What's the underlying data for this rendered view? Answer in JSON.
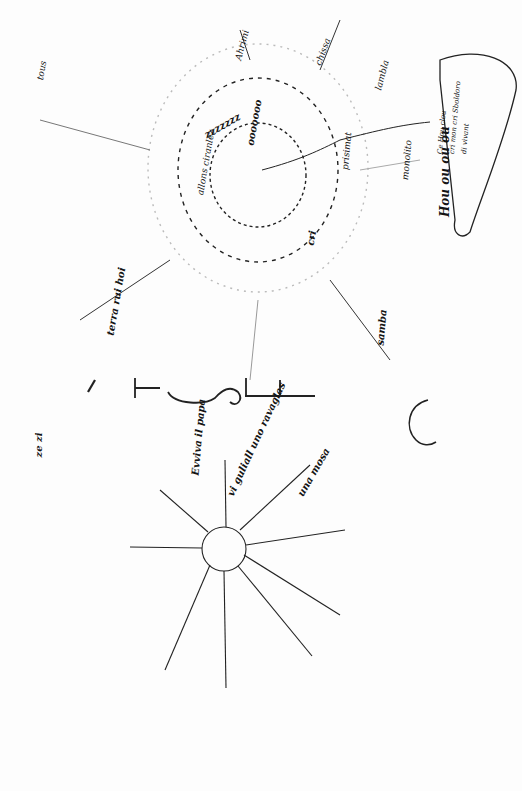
{
  "document": {
    "type": "handwritten manuscript scan (free-word poem)",
    "title_letters": [
      "T",
      "S",
      "F"
    ],
    "side_label": "Hou ou ou ou",
    "bubble_text": [
      "Ce Hou clou",
      "cri mon cri Sboldoro",
      "di vivant"
    ],
    "upper_radiant": {
      "rays": [
        "Rosa",
        "Ahrimi",
        "chissa",
        "lambla",
        "prisimat",
        "monolito",
        "samba",
        "allons ciranlez",
        "terra rui hoi",
        "trista",
        "tous",
        "ce",
        "cri"
      ],
      "spiral_fragments": [
        "cri",
        "cri",
        "cri",
        "ooooooo",
        "zzzzzzz",
        "ce",
        "ce"
      ]
    },
    "lower_radiant": {
      "rays": [
        "Evviva il papa",
        "vi guliall uno ravaglas",
        "una mosa",
        "allo",
        "di",
        "forte"
      ]
    },
    "margin_note": "ze zi",
    "small_circle": "C"
  }
}
